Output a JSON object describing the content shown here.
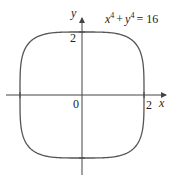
{
  "chart_data": {
    "type": "line",
    "title": "",
    "equation": "x^4 + y^4 = 16",
    "equation_display": {
      "x": "x",
      "exp": "4",
      "plus": "+",
      "y": "y",
      "equals": "= 16"
    },
    "xlabel": "x",
    "ylabel": "y",
    "xlim": [
      -2.6,
      2.6
    ],
    "ylim": [
      -2.3,
      2.3
    ],
    "x_ticks": [
      {
        "value": 2,
        "label": "2"
      }
    ],
    "y_ticks": [
      {
        "value": 2,
        "label": "2"
      }
    ],
    "origin_label": "0",
    "grid": false,
    "legend": null,
    "series": [
      {
        "name": "x^4 + y^4 = 16",
        "implicit": true,
        "exponent": 4,
        "radius": 2,
        "key_points": [
          [
            2,
            0
          ],
          [
            0,
            2
          ],
          [
            -2,
            0
          ],
          [
            0,
            -2
          ],
          [
            1.68,
            1.68
          ],
          [
            -1.68,
            1.68
          ],
          [
            -1.68,
            -1.68
          ],
          [
            1.68,
            -1.68
          ]
        ]
      }
    ]
  },
  "colors": {
    "curve": "#555555",
    "axis": "#444444",
    "text": "#222222"
  }
}
